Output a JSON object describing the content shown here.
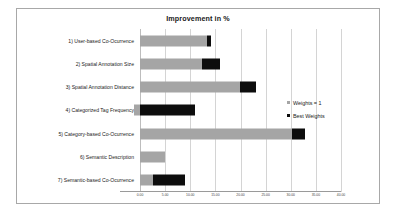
{
  "chart_data": {
    "type": "bar",
    "orientation": "horizontal",
    "stacked": true,
    "title": "Improvement in %",
    "xlabel": "",
    "ylabel": "",
    "xlim": [
      0,
      40
    ],
    "xticks": [
      "0.00",
      "5.00",
      "10.00",
      "15.00",
      "20.00",
      "25.00",
      "30.00",
      "35.00",
      "40.00"
    ],
    "xtick_values": [
      0,
      5,
      10,
      15,
      20,
      25,
      30,
      35,
      40
    ],
    "grid": true,
    "legend_position": "right",
    "categories": [
      "1) User-based Co-Ocurrence",
      "2) Spatial Annotation Size",
      "3) Spatial Annotation Distance",
      "4) Categorized Tag Frequency",
      "5) Category-based Co-Ocurrence",
      "6) Semantic Description",
      "7) Semantic-based Co-Ocurrence"
    ],
    "series": [
      {
        "name": "Weights = 1",
        "color": "#a5a5a5",
        "starts": [
          0,
          0,
          0,
          -1.1,
          0,
          0,
          0
        ],
        "values": [
          13.4,
          12.4,
          19.9,
          1.1,
          30.3,
          5.0,
          2.6
        ]
      },
      {
        "name": "Best Weights",
        "color": "#0d0d0d",
        "starts": [
          13.4,
          12.4,
          19.9,
          0,
          30.3,
          null,
          2.6
        ],
        "values": [
          0.7,
          3.6,
          3.1,
          11.0,
          2.6,
          0,
          6.4
        ]
      }
    ],
    "totals": [
      14.1,
      16.0,
      23.0,
      11.0,
      32.9,
      5.0,
      9.0
    ]
  },
  "legend": {
    "items": [
      {
        "label": "Weights = 1",
        "color": "#a5a5a5"
      },
      {
        "label": "Best Weights",
        "color": "#0d0d0d"
      }
    ]
  }
}
